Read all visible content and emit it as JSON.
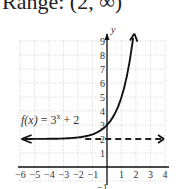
{
  "header": {
    "text": "Range: (2, ∞)"
  },
  "chart_data": {
    "type": "line",
    "title": "",
    "function_label": "f(x) = 3^x + 2",
    "xlabel": "",
    "ylabel": "y",
    "xlim": [
      -6,
      4
    ],
    "ylim": [
      -1,
      9
    ],
    "x_ticks": [
      "-6",
      "-5",
      "-4",
      "-3",
      "-2",
      "-1",
      "1",
      "2",
      "3",
      "4"
    ],
    "y_ticks": [
      "-1",
      "1",
      "2",
      "3",
      "4",
      "5",
      "6",
      "7",
      "8",
      "9"
    ],
    "grid": true,
    "asymptote": {
      "type": "horizontal",
      "y": 2,
      "style": "dashed"
    },
    "series": [
      {
        "name": "f(x) = 3^x + 2",
        "x": [
          -6,
          -4,
          -3,
          -2,
          -1,
          0,
          0.5,
          1,
          1.5,
          1.9
        ],
        "y": [
          2.0014,
          2.012,
          2.037,
          2.111,
          2.333,
          3,
          3.732,
          5,
          7.196,
          10.06
        ]
      }
    ]
  },
  "labels": {
    "fx": "f(x)",
    "eq": " = 3",
    "exp": "x",
    "plus": " + 2",
    "y_axis": "y"
  }
}
